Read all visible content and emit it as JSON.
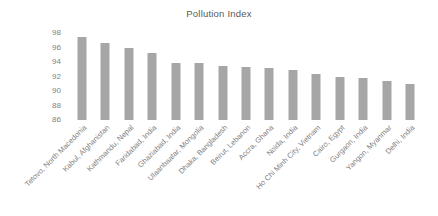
{
  "chart_data": {
    "type": "bar",
    "title": "Pollution Index",
    "xlabel": "",
    "ylabel": "",
    "ylim": [
      86,
      98
    ],
    "yticks": [
      98,
      96,
      94,
      92,
      90,
      88,
      86
    ],
    "grid": false,
    "legend": false,
    "bar_color": "#a6a6a6",
    "text_color": "#7f7f7f",
    "background": "#ffffff",
    "categories": [
      "Tetovo, North Macedonia",
      "Kabul, Afghanistan",
      "Kathmandu, Nepal",
      "Faridabad, India",
      "Ghaziabad, India",
      "Ulaanbaatar, Mongolia",
      "Dhaka, Bangladesh",
      "Beirut, Lebanon",
      "Accra, Ghana",
      "Noida, India",
      "Ho Chi Minh City, Vietnam",
      "Cairo, Egypt",
      "Gurgaon, India",
      "Yangon, Myanmar",
      "Delhi, India"
    ],
    "values": [
      97.5,
      96.6,
      96.0,
      95.3,
      93.8,
      93.8,
      93.4,
      93.3,
      93.2,
      92.9,
      92.4,
      92.0,
      91.8,
      91.4,
      91.0
    ]
  }
}
